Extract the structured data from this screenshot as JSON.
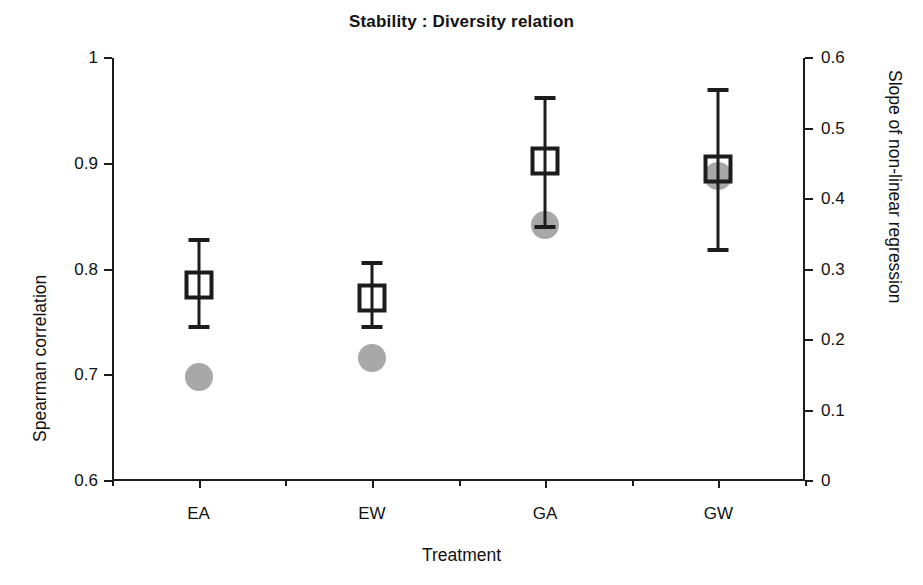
{
  "chart_data": {
    "type": "scatter",
    "title": "Stability : Diversity relation",
    "xlabel": "Treatment",
    "ylabel": "Spearman correlation",
    "y2label": "Slope of non-linear regression",
    "categories": [
      "EA",
      "EW",
      "GA",
      "GW"
    ],
    "ylim": [
      0.6,
      1
    ],
    "y2lim": [
      0,
      0.6
    ],
    "yticks": [
      "0.6",
      "0.7",
      "0.8",
      "0.9",
      "1"
    ],
    "ytick_values": [
      0.6,
      0.7,
      0.8,
      0.9,
      1
    ],
    "y2ticks": [
      "0",
      "0.1",
      "0.2",
      "0.3",
      "0.4",
      "0.5",
      "0.6"
    ],
    "y2tick_values": [
      0,
      0.1,
      0.2,
      0.3,
      0.4,
      0.5,
      0.6
    ],
    "grid": false,
    "legend": "none",
    "series": [
      {
        "name": "Spearman correlation",
        "marker": "open-square",
        "color": "#1c1c1c",
        "axis": "left",
        "values": [
          0.785,
          0.773,
          0.903,
          0.895
        ],
        "error_low": [
          0.746,
          0.746,
          0.84,
          0.818
        ],
        "error_high": [
          0.828,
          0.806,
          0.962,
          0.97
        ]
      },
      {
        "name": "Slope of non-linear regression",
        "marker": "filled-circle",
        "color": "#a8a8a8",
        "axis": "right",
        "values": [
          0.147,
          0.175,
          0.363,
          0.432
        ]
      }
    ]
  },
  "figure": {
    "background": "#ffffff",
    "axis_color": "#1c1c1c"
  }
}
